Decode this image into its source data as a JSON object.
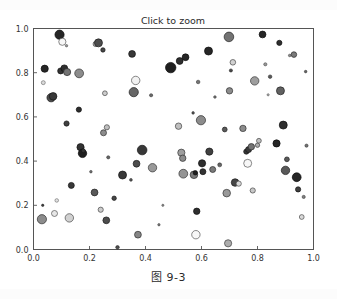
{
  "figure": {
    "title": "Click to zoom",
    "caption": "图 9-3",
    "width": 337,
    "height": 299,
    "background_color": "#ffffff",
    "axes_color": "#444444",
    "tick_label_color": "#333333"
  },
  "chart_data": {
    "type": "scatter",
    "title": "Click to zoom",
    "xlabel": "",
    "ylabel": "",
    "xlim": [
      0.0,
      1.0
    ],
    "ylim": [
      0.0,
      1.0
    ],
    "xticks": [
      "0.0",
      "0.2",
      "0.4",
      "0.6",
      "0.8",
      "1.0"
    ],
    "yticks": [
      "0.0",
      "0.2",
      "0.4",
      "0.6",
      "0.8",
      "1.0"
    ],
    "xtick_values": [
      0.0,
      0.2,
      0.4,
      0.6,
      0.8,
      1.0
    ],
    "ytick_values": [
      0.0,
      0.2,
      0.4,
      0.6,
      0.8,
      1.0
    ],
    "grid": false,
    "legend": null,
    "marker": "circle",
    "colormap": "grayscale",
    "n_points": 104,
    "note": "Random bubble scatter: x, y in [0,1]; size s is marker radius in px; c is grayscale fill level 0-1 (0=black, 1=white); markers have thin dark edges",
    "points": [
      {
        "x": 0.03,
        "y": 0.137,
        "s": 4.6,
        "c": 0.55
      },
      {
        "x": 0.033,
        "y": 0.2,
        "s": 1.2,
        "c": 0.25
      },
      {
        "x": 0.035,
        "y": 0.755,
        "s": 2.0,
        "c": 0.85
      },
      {
        "x": 0.04,
        "y": 0.818,
        "s": 3.6,
        "c": 0.15
      },
      {
        "x": 0.063,
        "y": 0.687,
        "s": 4.2,
        "c": 0.3
      },
      {
        "x": 0.07,
        "y": 0.693,
        "s": 3.8,
        "c": 0.22
      },
      {
        "x": 0.075,
        "y": 0.163,
        "s": 3.0,
        "c": 0.9
      },
      {
        "x": 0.083,
        "y": 0.222,
        "s": 1.8,
        "c": 0.88
      },
      {
        "x": 0.093,
        "y": 0.972,
        "s": 4.6,
        "c": 0.15
      },
      {
        "x": 0.097,
        "y": 0.808,
        "s": 3.0,
        "c": 0.2
      },
      {
        "x": 0.103,
        "y": 0.94,
        "s": 3.6,
        "c": 0.97
      },
      {
        "x": 0.11,
        "y": 0.82,
        "s": 3.4,
        "c": 0.18
      },
      {
        "x": 0.118,
        "y": 0.57,
        "s": 2.6,
        "c": 0.25
      },
      {
        "x": 0.12,
        "y": 0.803,
        "s": 3.6,
        "c": 0.45
      },
      {
        "x": 0.128,
        "y": 0.143,
        "s": 4.2,
        "c": 0.82
      },
      {
        "x": 0.135,
        "y": 0.29,
        "s": 3.0,
        "c": 0.22
      },
      {
        "x": 0.162,
        "y": 0.633,
        "s": 2.6,
        "c": 0.18
      },
      {
        "x": 0.163,
        "y": 0.797,
        "s": 4.4,
        "c": 0.55
      },
      {
        "x": 0.168,
        "y": 0.463,
        "s": 3.6,
        "c": 0.2
      },
      {
        "x": 0.175,
        "y": 0.435,
        "s": 4.2,
        "c": 0.12
      },
      {
        "x": 0.178,
        "y": 0.447,
        "s": 2.0,
        "c": 0.2
      },
      {
        "x": 0.218,
        "y": 0.258,
        "s": 3.4,
        "c": 0.35
      },
      {
        "x": 0.222,
        "y": 0.93,
        "s": 2.6,
        "c": 0.75
      },
      {
        "x": 0.232,
        "y": 0.935,
        "s": 4.0,
        "c": 0.3
      },
      {
        "x": 0.24,
        "y": 0.18,
        "s": 2.6,
        "c": 0.8
      },
      {
        "x": 0.248,
        "y": 0.903,
        "s": 2.2,
        "c": 0.28
      },
      {
        "x": 0.25,
        "y": 0.528,
        "s": 3.0,
        "c": 0.55
      },
      {
        "x": 0.255,
        "y": 0.707,
        "s": 2.4,
        "c": 0.8
      },
      {
        "x": 0.26,
        "y": 0.132,
        "s": 3.4,
        "c": 0.3
      },
      {
        "x": 0.262,
        "y": 0.553,
        "s": 2.6,
        "c": 0.75
      },
      {
        "x": 0.267,
        "y": 0.417,
        "s": 1.6,
        "c": 0.4
      },
      {
        "x": 0.288,
        "y": 0.232,
        "s": 2.2,
        "c": 0.28
      },
      {
        "x": 0.3,
        "y": 0.01,
        "s": 1.8,
        "c": 0.3
      },
      {
        "x": 0.318,
        "y": 0.337,
        "s": 4.0,
        "c": 0.22
      },
      {
        "x": 0.348,
        "y": 0.315,
        "s": 1.4,
        "c": 0.35
      },
      {
        "x": 0.352,
        "y": 0.885,
        "s": 3.4,
        "c": 0.22
      },
      {
        "x": 0.358,
        "y": 0.712,
        "s": 4.6,
        "c": 0.4
      },
      {
        "x": 0.365,
        "y": 0.765,
        "s": 4.2,
        "c": 0.95
      },
      {
        "x": 0.368,
        "y": 0.388,
        "s": 3.4,
        "c": 0.3
      },
      {
        "x": 0.373,
        "y": 0.067,
        "s": 3.4,
        "c": 0.52
      },
      {
        "x": 0.388,
        "y": 0.45,
        "s": 4.8,
        "c": 0.22
      },
      {
        "x": 0.42,
        "y": 0.698,
        "s": 1.6,
        "c": 0.42
      },
      {
        "x": 0.425,
        "y": 0.37,
        "s": 4.2,
        "c": 0.6
      },
      {
        "x": 0.49,
        "y": 0.823,
        "s": 5.2,
        "c": 0.12
      },
      {
        "x": 0.518,
        "y": 0.558,
        "s": 3.2,
        "c": 0.75
      },
      {
        "x": 0.522,
        "y": 0.853,
        "s": 3.4,
        "c": 0.18
      },
      {
        "x": 0.528,
        "y": 0.438,
        "s": 3.6,
        "c": 0.62
      },
      {
        "x": 0.533,
        "y": 0.413,
        "s": 3.2,
        "c": 0.55
      },
      {
        "x": 0.535,
        "y": 0.343,
        "s": 4.4,
        "c": 0.58
      },
      {
        "x": 0.543,
        "y": 0.87,
        "s": 3.4,
        "c": 0.15
      },
      {
        "x": 0.57,
        "y": 0.618,
        "s": 1.3,
        "c": 0.35
      },
      {
        "x": 0.573,
        "y": 0.338,
        "s": 3.8,
        "c": 0.48
      },
      {
        "x": 0.578,
        "y": 0.347,
        "s": 2.2,
        "c": 0.12
      },
      {
        "x": 0.58,
        "y": 0.067,
        "s": 4.2,
        "c": 0.97
      },
      {
        "x": 0.583,
        "y": 0.173,
        "s": 3.2,
        "c": 0.18
      },
      {
        "x": 0.588,
        "y": 0.758,
        "s": 1.8,
        "c": 0.45
      },
      {
        "x": 0.598,
        "y": 0.585,
        "s": 4.6,
        "c": 0.55
      },
      {
        "x": 0.602,
        "y": 0.39,
        "s": 3.6,
        "c": 0.18
      },
      {
        "x": 0.605,
        "y": 0.352,
        "s": 3.0,
        "c": 0.2
      },
      {
        "x": 0.625,
        "y": 0.898,
        "s": 4.0,
        "c": 0.15
      },
      {
        "x": 0.628,
        "y": 0.443,
        "s": 3.6,
        "c": 0.25
      },
      {
        "x": 0.64,
        "y": 0.362,
        "s": 3.0,
        "c": 0.48
      },
      {
        "x": 0.648,
        "y": 0.69,
        "s": 1.3,
        "c": 0.48
      },
      {
        "x": 0.665,
        "y": 0.383,
        "s": 2.0,
        "c": 0.4
      },
      {
        "x": 0.683,
        "y": 0.543,
        "s": 2.4,
        "c": 0.35
      },
      {
        "x": 0.69,
        "y": 0.255,
        "s": 3.8,
        "c": 0.6
      },
      {
        "x": 0.695,
        "y": 0.028,
        "s": 3.6,
        "c": 0.68
      },
      {
        "x": 0.698,
        "y": 0.962,
        "s": 4.8,
        "c": 0.45
      },
      {
        "x": 0.7,
        "y": 0.718,
        "s": 3.2,
        "c": 0.55
      },
      {
        "x": 0.705,
        "y": 0.81,
        "s": 1.6,
        "c": 0.28
      },
      {
        "x": 0.712,
        "y": 0.847,
        "s": 2.8,
        "c": 0.82
      },
      {
        "x": 0.72,
        "y": 0.303,
        "s": 3.8,
        "c": 0.28
      },
      {
        "x": 0.733,
        "y": 0.298,
        "s": 2.6,
        "c": 0.85
      },
      {
        "x": 0.748,
        "y": 0.548,
        "s": 3.2,
        "c": 0.55
      },
      {
        "x": 0.76,
        "y": 0.443,
        "s": 2.6,
        "c": 0.22
      },
      {
        "x": 0.765,
        "y": 0.39,
        "s": 4.0,
        "c": 0.97
      },
      {
        "x": 0.768,
        "y": 0.452,
        "s": 3.0,
        "c": 0.22
      },
      {
        "x": 0.778,
        "y": 0.465,
        "s": 3.2,
        "c": 0.45
      },
      {
        "x": 0.783,
        "y": 0.267,
        "s": 2.6,
        "c": 0.78
      },
      {
        "x": 0.79,
        "y": 0.763,
        "s": 4.2,
        "c": 0.62
      },
      {
        "x": 0.8,
        "y": 0.472,
        "s": 2.2,
        "c": 0.68
      },
      {
        "x": 0.805,
        "y": 0.492,
        "s": 2.4,
        "c": 0.75
      },
      {
        "x": 0.818,
        "y": 0.973,
        "s": 3.4,
        "c": 0.15
      },
      {
        "x": 0.828,
        "y": 0.838,
        "s": 1.6,
        "c": 0.6
      },
      {
        "x": 0.838,
        "y": 0.7,
        "s": 1.1,
        "c": 0.7
      },
      {
        "x": 0.845,
        "y": 0.782,
        "s": 1.8,
        "c": 0.35
      },
      {
        "x": 0.868,
        "y": 0.48,
        "s": 3.6,
        "c": 0.15
      },
      {
        "x": 0.878,
        "y": 0.935,
        "s": 2.6,
        "c": 0.18
      },
      {
        "x": 0.882,
        "y": 0.718,
        "s": 4.0,
        "c": 0.38
      },
      {
        "x": 0.892,
        "y": 0.563,
        "s": 4.0,
        "c": 0.18
      },
      {
        "x": 0.9,
        "y": 0.358,
        "s": 4.2,
        "c": 0.35
      },
      {
        "x": 0.905,
        "y": 0.408,
        "s": 2.4,
        "c": 0.35
      },
      {
        "x": 0.915,
        "y": 0.878,
        "s": 1.3,
        "c": 0.55
      },
      {
        "x": 0.93,
        "y": 0.882,
        "s": 2.8,
        "c": 0.48
      },
      {
        "x": 0.94,
        "y": 0.327,
        "s": 4.4,
        "c": 0.15
      },
      {
        "x": 0.945,
        "y": 0.272,
        "s": 2.6,
        "c": 0.25
      },
      {
        "x": 0.958,
        "y": 0.147,
        "s": 2.4,
        "c": 0.85
      },
      {
        "x": 0.965,
        "y": 0.238,
        "s": 1.6,
        "c": 0.5
      },
      {
        "x": 0.972,
        "y": 0.805,
        "s": 1.3,
        "c": 0.4
      },
      {
        "x": 0.975,
        "y": 0.47,
        "s": 1.6,
        "c": 0.45
      },
      {
        "x": 0.448,
        "y": 0.112,
        "s": 1.2,
        "c": 0.5
      },
      {
        "x": 0.205,
        "y": 0.352,
        "s": 1.3,
        "c": 0.45
      },
      {
        "x": 0.462,
        "y": 0.2,
        "s": 1.1,
        "c": 0.55
      },
      {
        "x": 0.118,
        "y": 0.922,
        "s": 1.2,
        "c": 0.6
      }
    ]
  }
}
